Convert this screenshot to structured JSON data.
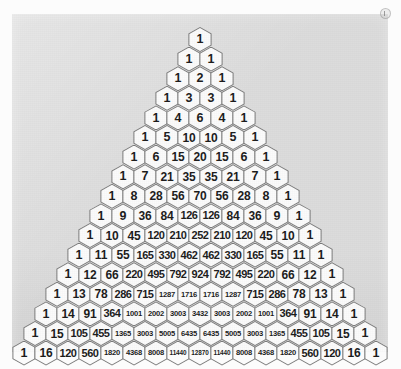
{
  "figure": {
    "name": "pascals-triangle",
    "rows_shown": 17,
    "top_row_index": 0,
    "bottom_row_index": 16,
    "cell_shape": "hexagon",
    "colors": {
      "panel_background": "#dcdcdc",
      "page_background": "#fcfcfc",
      "hexagon_fill": "#fbfbfb",
      "hexagon_outline": "#7b7b7b",
      "number_text": "#1b1b1b"
    }
  },
  "chart_data": {
    "type": "table",
    "subtitle": "",
    "xlabel": "",
    "ylabel": "",
    "legend": [],
    "grid": false,
    "rows": [
      [
        1
      ],
      [
        1,
        1
      ],
      [
        1,
        2,
        1
      ],
      [
        1,
        3,
        3,
        1
      ],
      [
        1,
        4,
        6,
        4,
        1
      ],
      [
        1,
        5,
        10,
        10,
        5,
        1
      ],
      [
        1,
        6,
        15,
        20,
        15,
        6,
        1
      ],
      [
        1,
        7,
        21,
        35,
        35,
        21,
        7,
        1
      ],
      [
        1,
        8,
        28,
        56,
        70,
        56,
        28,
        8,
        1
      ],
      [
        1,
        9,
        36,
        84,
        126,
        126,
        84,
        36,
        9,
        1
      ],
      [
        1,
        10,
        45,
        120,
        210,
        252,
        210,
        120,
        45,
        10,
        1
      ],
      [
        1,
        11,
        55,
        165,
        330,
        462,
        462,
        330,
        165,
        55,
        11,
        1
      ],
      [
        1,
        12,
        66,
        220,
        495,
        792,
        924,
        792,
        495,
        220,
        66,
        12,
        1
      ],
      [
        1,
        13,
        78,
        286,
        715,
        1287,
        1716,
        1716,
        1287,
        715,
        286,
        78,
        13,
        1
      ],
      [
        1,
        14,
        91,
        364,
        1001,
        2002,
        3003,
        3432,
        3003,
        2002,
        1001,
        364,
        91,
        14,
        1
      ],
      [
        1,
        15,
        105,
        455,
        1365,
        3003,
        5005,
        6435,
        6435,
        5005,
        3003,
        1365,
        455,
        105,
        15,
        1
      ],
      [
        1,
        16,
        120,
        560,
        1820,
        4368,
        8008,
        11440,
        12870,
        11440,
        8008,
        4368,
        1820,
        560,
        120,
        16,
        1
      ]
    ]
  },
  "marks": {
    "corner_registration_mark": "registration-mark"
  }
}
